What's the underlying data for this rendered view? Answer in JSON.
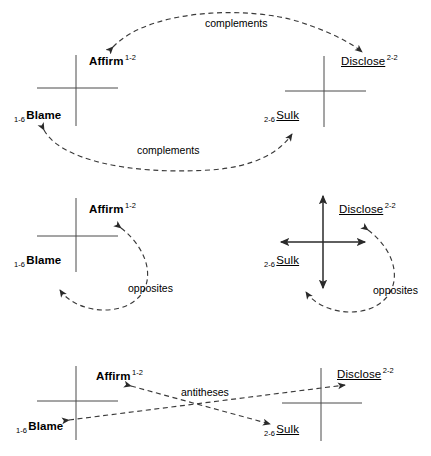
{
  "diagram": {
    "stroke_color": "#3a3a3a",
    "text_color": "#000000",
    "panels": [
      {
        "id": "complements",
        "relation": "complements",
        "edge_labels": [
          {
            "text": "complements"
          },
          {
            "text": "complements"
          }
        ],
        "nodes": [
          {
            "id": "affirm",
            "name": "Affirm",
            "code": "1-2",
            "code_position": "superscript",
            "style": "bold"
          },
          {
            "id": "blame",
            "name": "Blame",
            "code": "1-6",
            "code_position": "prefix",
            "style": "bold"
          },
          {
            "id": "disclose",
            "name": "Disclose",
            "code": "2-2",
            "code_position": "superscript",
            "style": "underline"
          },
          {
            "id": "sulk",
            "name": "Sulk",
            "code": "2-6",
            "code_position": "prefix",
            "style": "underline"
          }
        ]
      },
      {
        "id": "opposites",
        "relation": "opposites",
        "edge_labels": [
          {
            "text": "opposites"
          },
          {
            "text": "opposites"
          }
        ],
        "nodes": [
          {
            "id": "affirm",
            "name": "Affirm",
            "code": "1-2",
            "code_position": "superscript",
            "style": "bold"
          },
          {
            "id": "blame",
            "name": "Blame",
            "code": "1-6",
            "code_position": "prefix",
            "style": "bold"
          },
          {
            "id": "disclose",
            "name": "Disclose",
            "code": "2-2",
            "code_position": "superscript",
            "style": "underline"
          },
          {
            "id": "sulk",
            "name": "Sulk",
            "code": "2-6",
            "code_position": "prefix",
            "style": "underline"
          }
        ]
      },
      {
        "id": "antitheses",
        "relation": "antitheses",
        "edge_labels": [
          {
            "text": "antitheses"
          }
        ],
        "nodes": [
          {
            "id": "affirm",
            "name": "Affirm",
            "code": "1-2",
            "code_position": "superscript",
            "style": "bold"
          },
          {
            "id": "blame",
            "name": "Blame",
            "code": "1-6",
            "code_position": "prefix",
            "style": "bold"
          },
          {
            "id": "disclose",
            "name": "Disclose",
            "code": "2-2",
            "code_position": "superscript",
            "style": "underline"
          },
          {
            "id": "sulk",
            "name": "Sulk",
            "code": "2-6",
            "code_position": "prefix",
            "style": "underline"
          }
        ]
      }
    ],
    "labels": {
      "affirm_name": "Affirm",
      "affirm_code": "1-2",
      "blame_name": "Blame",
      "blame_code": "1-6",
      "disclose_name": "Disclose",
      "disclose_code": "2-2",
      "sulk_name": "Sulk",
      "sulk_code": "2-6",
      "complements": "complements",
      "opposites": "opposites",
      "antitheses": "antitheses"
    }
  }
}
